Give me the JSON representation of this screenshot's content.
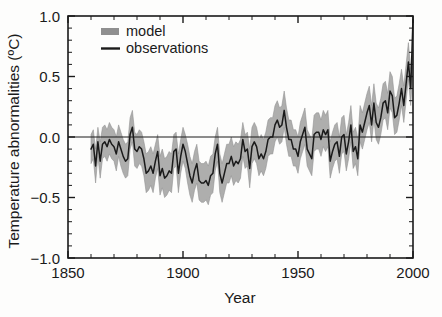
{
  "chart_data": {
    "type": "line",
    "title": "",
    "xlabel": "Year",
    "ylabel": "Temperature abnormalities (ºC)",
    "xlim": [
      1850,
      2000
    ],
    "ylim": [
      -1.0,
      1.0
    ],
    "xticks": [
      1850,
      1900,
      1950,
      2000
    ],
    "xtick_labels": [
      "1850",
      "1900",
      "1950",
      "2000"
    ],
    "yticks": [
      -1.0,
      -0.5,
      0.0,
      0.5,
      1.0
    ],
    "ytick_labels": [
      "-1.0",
      "-0.5",
      "0.0",
      "0.5",
      "1.0"
    ],
    "x_minor_tick_step": 10,
    "y_minor_tick_step": 0.1,
    "grid": false,
    "zero_reference_line": 0.0,
    "legend_position": "upper-left-inside",
    "legend": [
      {
        "name": "model",
        "marker": "band",
        "color": "#8f8f8f"
      },
      {
        "name": "observations",
        "marker": "line",
        "color": "#1a1a1a"
      }
    ],
    "x": [
      1860,
      1861,
      1862,
      1863,
      1864,
      1865,
      1866,
      1867,
      1868,
      1869,
      1870,
      1871,
      1872,
      1873,
      1874,
      1875,
      1876,
      1877,
      1878,
      1879,
      1880,
      1881,
      1882,
      1883,
      1884,
      1885,
      1886,
      1887,
      1888,
      1889,
      1890,
      1891,
      1892,
      1893,
      1894,
      1895,
      1896,
      1897,
      1898,
      1899,
      1900,
      1901,
      1902,
      1903,
      1904,
      1905,
      1906,
      1907,
      1908,
      1909,
      1910,
      1911,
      1912,
      1913,
      1914,
      1915,
      1916,
      1917,
      1918,
      1919,
      1920,
      1921,
      1922,
      1923,
      1924,
      1925,
      1926,
      1927,
      1928,
      1929,
      1930,
      1931,
      1932,
      1933,
      1934,
      1935,
      1936,
      1937,
      1938,
      1939,
      1940,
      1941,
      1942,
      1943,
      1944,
      1945,
      1946,
      1947,
      1948,
      1949,
      1950,
      1951,
      1952,
      1953,
      1954,
      1955,
      1956,
      1957,
      1958,
      1959,
      1960,
      1961,
      1962,
      1963,
      1964,
      1965,
      1966,
      1967,
      1968,
      1969,
      1970,
      1971,
      1972,
      1973,
      1974,
      1975,
      1976,
      1977,
      1978,
      1979,
      1980,
      1981,
      1982,
      1983,
      1984,
      1985,
      1986,
      1987,
      1988,
      1989,
      1990,
      1991,
      1992,
      1993,
      1994,
      1995,
      1996,
      1997,
      1998,
      1999,
      2000
    ],
    "series": [
      {
        "name": "observations",
        "color": "#1a1a1a",
        "values": [
          -0.1,
          -0.06,
          -0.24,
          -0.04,
          -0.2,
          -0.06,
          -0.04,
          -0.08,
          -0.02,
          -0.06,
          -0.08,
          -0.14,
          -0.04,
          -0.1,
          -0.16,
          -0.2,
          -0.18,
          0.02,
          0.08,
          -0.1,
          -0.12,
          -0.08,
          -0.1,
          -0.18,
          -0.3,
          -0.28,
          -0.24,
          -0.3,
          -0.2,
          -0.12,
          -0.32,
          -0.26,
          -0.34,
          -0.32,
          -0.28,
          -0.3,
          -0.12,
          -0.1,
          -0.3,
          -0.16,
          -0.06,
          -0.12,
          -0.22,
          -0.32,
          -0.38,
          -0.28,
          -0.22,
          -0.36,
          -0.38,
          -0.38,
          -0.36,
          -0.4,
          -0.32,
          -0.3,
          -0.14,
          -0.06,
          -0.3,
          -0.38,
          -0.3,
          -0.22,
          -0.22,
          -0.16,
          -0.24,
          -0.2,
          -0.22,
          -0.18,
          -0.02,
          -0.12,
          -0.1,
          -0.26,
          -0.08,
          -0.04,
          -0.08,
          -0.18,
          -0.14,
          -0.18,
          -0.12,
          -0.02,
          0.0,
          0.0,
          0.1,
          0.14,
          0.08,
          0.1,
          0.22,
          0.08,
          -0.02,
          -0.02,
          -0.1,
          -0.1,
          -0.16,
          -0.04,
          0.02,
          0.08,
          -0.1,
          -0.14,
          -0.18,
          0.02,
          0.04,
          0.04,
          -0.02,
          0.06,
          0.02,
          0.06,
          -0.2,
          -0.12,
          -0.06,
          -0.04,
          -0.16,
          0.0,
          0.02,
          -0.14,
          -0.04,
          0.1,
          -0.12,
          -0.08,
          -0.18,
          0.1,
          0.04,
          0.12,
          0.2,
          0.26,
          0.1,
          0.28,
          0.12,
          0.08,
          0.16,
          0.28,
          0.3,
          0.2,
          0.38,
          0.34,
          0.16,
          0.18,
          0.28,
          0.4,
          0.26,
          0.44,
          0.62,
          0.4,
          0.97
        ]
      },
      {
        "name": "model",
        "color": "#8f8f8f",
        "band_upper": [
          0.02,
          0.06,
          -0.1,
          0.08,
          -0.04,
          0.08,
          0.1,
          0.06,
          0.12,
          0.08,
          0.06,
          0.0,
          0.1,
          0.04,
          -0.02,
          -0.06,
          -0.04,
          0.16,
          0.22,
          0.04,
          0.02,
          0.06,
          0.04,
          -0.04,
          -0.14,
          -0.12,
          -0.08,
          -0.14,
          -0.06,
          0.02,
          -0.16,
          -0.1,
          -0.18,
          -0.16,
          -0.12,
          -0.14,
          0.02,
          0.04,
          -0.14,
          -0.02,
          0.08,
          0.02,
          -0.06,
          -0.16,
          -0.22,
          -0.12,
          -0.06,
          -0.2,
          -0.22,
          -0.22,
          -0.2,
          -0.24,
          -0.16,
          -0.14,
          0.0,
          0.08,
          -0.14,
          -0.22,
          -0.14,
          -0.06,
          -0.06,
          0.0,
          -0.08,
          -0.04,
          -0.06,
          -0.02,
          0.12,
          0.02,
          0.04,
          -0.1,
          0.08,
          0.12,
          0.08,
          -0.02,
          0.02,
          -0.02,
          0.04,
          0.14,
          0.16,
          0.16,
          0.26,
          0.3,
          0.24,
          0.26,
          0.38,
          0.24,
          0.14,
          0.14,
          0.06,
          0.06,
          0.0,
          0.12,
          0.18,
          0.24,
          0.06,
          0.02,
          -0.02,
          0.18,
          0.2,
          0.2,
          0.14,
          0.22,
          0.18,
          0.22,
          -0.04,
          0.04,
          0.1,
          0.12,
          0.0,
          0.16,
          0.18,
          0.02,
          0.12,
          0.26,
          0.04,
          0.08,
          -0.02,
          0.26,
          0.2,
          0.28,
          0.36,
          0.42,
          0.26,
          0.44,
          0.28,
          0.24,
          0.32,
          0.44,
          0.46,
          0.36,
          0.54,
          0.5,
          0.32,
          0.34,
          0.44,
          0.56,
          0.42,
          0.6,
          0.78,
          0.56,
          0.72
        ],
        "band_lower": [
          -0.22,
          -0.18,
          -0.38,
          -0.16,
          -0.34,
          -0.18,
          -0.16,
          -0.2,
          -0.14,
          -0.18,
          -0.2,
          -0.28,
          -0.16,
          -0.24,
          -0.3,
          -0.34,
          -0.32,
          -0.1,
          -0.04,
          -0.24,
          -0.26,
          -0.22,
          -0.24,
          -0.32,
          -0.46,
          -0.44,
          -0.4,
          -0.46,
          -0.34,
          -0.26,
          -0.48,
          -0.42,
          -0.5,
          -0.48,
          -0.44,
          -0.46,
          -0.26,
          -0.24,
          -0.46,
          -0.3,
          -0.2,
          -0.26,
          -0.38,
          -0.48,
          -0.54,
          -0.44,
          -0.38,
          -0.52,
          -0.54,
          -0.54,
          -0.52,
          -0.56,
          -0.48,
          -0.46,
          -0.28,
          -0.2,
          -0.46,
          -0.54,
          -0.46,
          -0.38,
          -0.38,
          -0.32,
          -0.4,
          -0.36,
          -0.38,
          -0.34,
          -0.16,
          -0.26,
          -0.24,
          -0.42,
          -0.22,
          -0.18,
          -0.22,
          -0.32,
          -0.28,
          -0.32,
          -0.26,
          -0.16,
          -0.14,
          -0.14,
          -0.04,
          0.0,
          -0.06,
          -0.04,
          0.08,
          -0.06,
          -0.16,
          -0.16,
          -0.24,
          -0.24,
          -0.3,
          -0.18,
          -0.12,
          -0.06,
          -0.24,
          -0.28,
          -0.32,
          -0.12,
          -0.1,
          -0.1,
          -0.16,
          -0.08,
          -0.12,
          -0.08,
          -0.34,
          -0.26,
          -0.2,
          -0.18,
          -0.3,
          -0.14,
          -0.12,
          -0.28,
          -0.18,
          -0.04,
          -0.26,
          -0.22,
          -0.32,
          -0.04,
          -0.1,
          -0.02,
          0.06,
          0.12,
          -0.04,
          0.14,
          -0.02,
          -0.06,
          0.02,
          0.14,
          0.16,
          0.06,
          0.24,
          0.2,
          0.02,
          0.04,
          0.14,
          0.26,
          0.12,
          0.3,
          0.48,
          0.26,
          0.58
        ]
      }
    ]
  }
}
